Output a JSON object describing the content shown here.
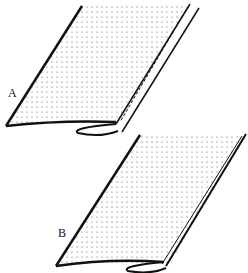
{
  "figure": {
    "panels": [
      {
        "label": "A",
        "description": "fabric folded with single stitching line near edge"
      },
      {
        "label": "B",
        "description": "fabric folded with edge stitching over fold"
      }
    ],
    "colors": {
      "line": "#111111",
      "dots": "#555555",
      "background": "#ffffff"
    }
  }
}
